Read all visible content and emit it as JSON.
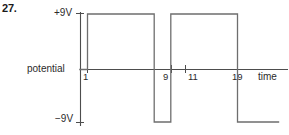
{
  "figure": {
    "question_number": "27.",
    "axis_labels": {
      "y_top": "+9V",
      "y_bottom": "−9V",
      "y_axis": "potential",
      "x_axis": "time"
    },
    "tick_labels": {
      "t1": "1",
      "t9": "9",
      "t11": "11",
      "t19": "19"
    },
    "colors": {
      "line": "#6e6e6e",
      "axis": "#4d4d4d",
      "text": "#231f20",
      "background": "#ffffff"
    }
  },
  "chart_data": {
    "type": "line",
    "title": "",
    "subtitle": "",
    "xlabel": "time",
    "ylabel": "potential",
    "grid": false,
    "legend": null,
    "ylim": [
      -9,
      9
    ],
    "ytick_values": [
      9,
      0,
      -9
    ],
    "ytick_labels": [
      "+9V",
      "0",
      "−9V"
    ],
    "xtick_values": [
      1,
      9,
      11,
      19
    ],
    "xtick_labels": [
      "1",
      "9",
      "11",
      "19"
    ],
    "waveform": "square",
    "units": {
      "y": "V",
      "x": "s"
    },
    "series": [
      {
        "name": "potential",
        "x": [
          0,
          1,
          1,
          9,
          9,
          11,
          11,
          19,
          19,
          24
        ],
        "values": [
          0,
          0,
          9,
          9,
          -9,
          -9,
          9,
          9,
          -9,
          -9
        ]
      }
    ],
    "segments": [
      {
        "from_t": 0,
        "to_t": 1,
        "level": 0
      },
      {
        "from_t": 1,
        "to_t": 9,
        "level": 9
      },
      {
        "from_t": 9,
        "to_t": 11,
        "level": -9
      },
      {
        "from_t": 11,
        "to_t": 19,
        "level": 9
      },
      {
        "from_t": 19,
        "to_t": 24,
        "level": -9
      }
    ]
  }
}
